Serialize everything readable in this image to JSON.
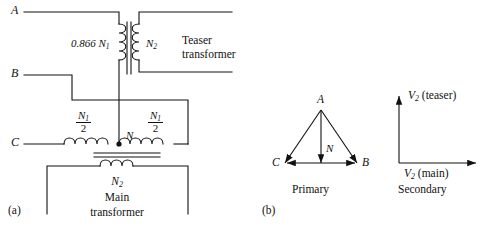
{
  "figure": {
    "part_a_label": "(a)",
    "part_b_label": "(b)"
  },
  "circuit": {
    "terminals": {
      "a": "A",
      "b": "B",
      "c": "C",
      "neutral": "N"
    },
    "teaser": {
      "primary_turns": "0.866 N",
      "primary_turns_sub": "1",
      "secondary_turns": "N",
      "secondary_turns_sub": "2",
      "name_line1": "Teaser",
      "name_line2": "transformer"
    },
    "main": {
      "half_turns_num": "N",
      "half_turns_num_sub": "1",
      "half_turns_den": "2",
      "secondary_turns": "N",
      "secondary_turns_sub": "2",
      "name_line1": "Main",
      "name_line2": "transformer"
    }
  },
  "phasors": {
    "primary": {
      "caption": "Primary",
      "vertices": {
        "a": "A",
        "b": "B",
        "c": "C",
        "n": "N"
      }
    },
    "secondary": {
      "caption": "Secondary",
      "y_axis_label": "V",
      "y_axis_sub": "2",
      "y_axis_suffix": " (teaser)",
      "x_axis_label": "V",
      "x_axis_sub": "2",
      "x_axis_suffix": " (main)"
    }
  },
  "colors": {
    "stroke": "#111111",
    "background": "#ffffff"
  }
}
